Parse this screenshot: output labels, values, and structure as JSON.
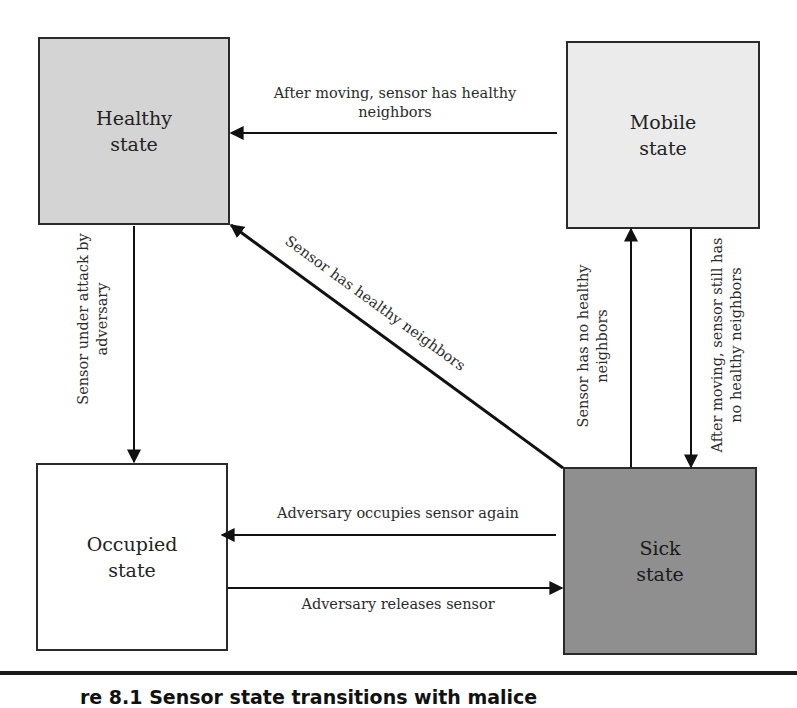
{
  "diagram": {
    "states": {
      "healthy": {
        "line1": "Healthy",
        "line2": "state",
        "fill": "#d4d4d4"
      },
      "mobile": {
        "line1": "Mobile",
        "line2": "state",
        "fill": "#ebebeb"
      },
      "occupied": {
        "line1": "Occupied",
        "line2": "state",
        "fill": "#ffffff"
      },
      "sick": {
        "line1": "Sick",
        "line2": "state",
        "fill": "#8f8f8f"
      }
    },
    "transitions": {
      "mobile_to_healthy": {
        "line1": "After moving, sensor has healthy",
        "line2": "neighbors"
      },
      "healthy_to_occupied": {
        "line1": "Sensor under attack by",
        "line2": "adversary"
      },
      "sick_to_healthy": {
        "line1": "Sensor has healthy neighbors"
      },
      "sick_to_mobile": {
        "line1": "Sensor has no healthy",
        "line2": "neighbors"
      },
      "mobile_to_sick": {
        "line1": "After moving, sensor still has",
        "line2": "no healthy neighbors"
      },
      "sick_to_occupied": {
        "line1": "Adversary occupies sensor again"
      },
      "occupied_to_sick": {
        "line1": "Adversary releases sensor"
      }
    },
    "caption": "re 8.1   Sensor state transitions with malice"
  }
}
